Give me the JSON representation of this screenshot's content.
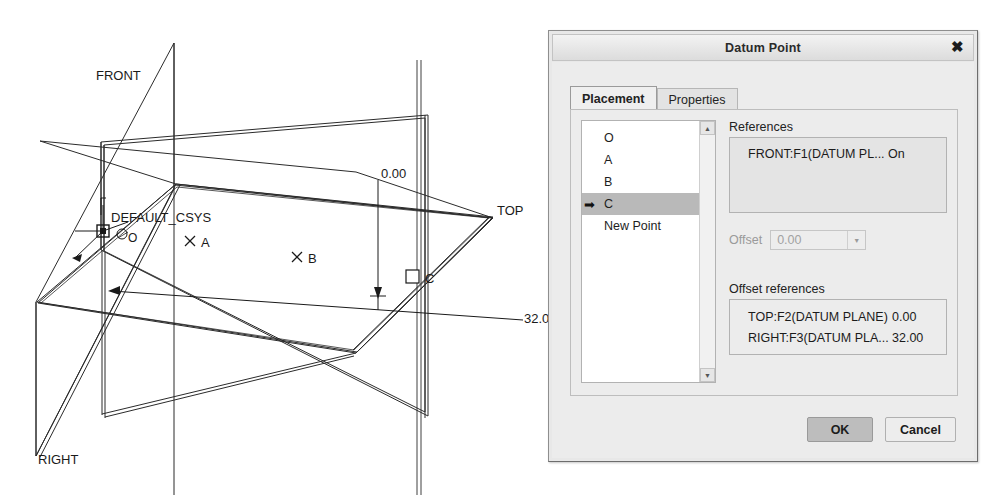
{
  "cad": {
    "labels": {
      "front_plane": "FRONT",
      "top_plane": "TOP",
      "right_plane": "RIGHT",
      "csys": "DEFAULT_CSYS",
      "point_o": "O",
      "point_a": "A",
      "point_b": "B",
      "point_c": "C"
    },
    "dimensions": {
      "vertical": "0.00",
      "horizontal": "32.00"
    }
  },
  "dialog": {
    "title": "Datum Point",
    "close_label": "✖",
    "tabs": [
      {
        "label": "Placement",
        "active": true
      },
      {
        "label": "Properties",
        "active": false
      }
    ],
    "point_list": {
      "items": [
        {
          "label": "O",
          "selected": false
        },
        {
          "label": "A",
          "selected": false
        },
        {
          "label": "B",
          "selected": false
        },
        {
          "label": "C",
          "selected": true
        },
        {
          "label": "New Point",
          "selected": false
        }
      ],
      "selected_marker": "➡",
      "scroll_up": "▲",
      "scroll_down": "▼"
    },
    "references": {
      "label": "References",
      "rows": [
        {
          "name": "FRONT:F1(DATUM PL...",
          "value": "On"
        }
      ]
    },
    "offset": {
      "label": "Offset",
      "value": "0.00",
      "dropdown_glyph": "▼"
    },
    "offset_references": {
      "label": "Offset references",
      "rows": [
        {
          "name": "TOP:F2(DATUM PLANE)",
          "value": "0.00"
        },
        {
          "name": "RIGHT:F3(DATUM PLA...",
          "value": "32.00"
        }
      ]
    },
    "buttons": {
      "ok": "OK",
      "cancel": "Cancel"
    }
  }
}
